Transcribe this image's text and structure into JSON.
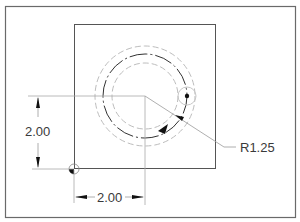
{
  "drawing": {
    "title": "Circle position and radius dimensions",
    "colors": {
      "frame": "#6a6a6a",
      "part_outline": "#555555",
      "main_circle": "#333333",
      "hidden_circle": "#bdbdbd",
      "dim_line": "#9a9a9a",
      "text": "#3a3a3a",
      "arrow": "#111111"
    },
    "dimensions": {
      "vertical": {
        "label": "2.00"
      },
      "horizontal": {
        "label": "2.00"
      },
      "radius": {
        "label": "R1.25"
      }
    }
  }
}
